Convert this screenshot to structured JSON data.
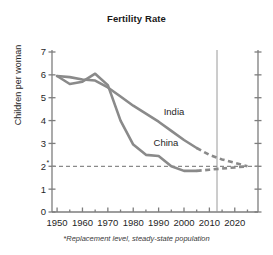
{
  "chart_data": {
    "type": "line",
    "title": "Fertility Rate",
    "xlabel": "",
    "ylabel": "Children per woman",
    "footnote": "*Replacement level, steady-state population",
    "xlim": [
      1948,
      1926
    ],
    "x_axis_range": [
      1948,
      2026
    ],
    "ylim": [
      0,
      7
    ],
    "y_ticks": [
      0,
      1,
      2,
      3,
      4,
      5,
      6,
      7
    ],
    "y_tick_labels": [
      "0",
      "1",
      "2",
      "3",
      "4",
      "5",
      "6",
      "7"
    ],
    "y_tick_label_2_suffix": "*",
    "x_ticks": [
      1950,
      1955,
      1960,
      1965,
      1970,
      1975,
      1980,
      1985,
      1990,
      1995,
      2000,
      2005,
      2010,
      2015,
      2020,
      2025
    ],
    "x_major_ticks": [
      1950,
      1960,
      1970,
      1980,
      1990,
      2000,
      2010,
      2020
    ],
    "x_tick_labels": [
      "1950",
      "1960",
      "1970",
      "1980",
      "1990",
      "2000",
      "2010",
      "2020"
    ],
    "grid": false,
    "legend_position": "inline-labels",
    "replacement_level": {
      "value": 2,
      "label": "2*",
      "style": "dashed",
      "color": "#8a8a8a"
    },
    "projection_divider_year": 2013,
    "line_color": "#8a8a8a",
    "series": [
      {
        "name": "India",
        "label": "India",
        "color": "#8a8a8a",
        "label_x": 1992,
        "label_y": 4.25,
        "observed": [
          {
            "x": 1950,
            "y": 5.95
          },
          {
            "x": 1955,
            "y": 5.9
          },
          {
            "x": 1960,
            "y": 5.8
          },
          {
            "x": 1965,
            "y": 5.75
          },
          {
            "x": 1970,
            "y": 5.45
          },
          {
            "x": 1975,
            "y": 5.05
          },
          {
            "x": 1980,
            "y": 4.65
          },
          {
            "x": 1985,
            "y": 4.3
          },
          {
            "x": 1990,
            "y": 3.95
          },
          {
            "x": 1995,
            "y": 3.55
          },
          {
            "x": 2000,
            "y": 3.15
          },
          {
            "x": 2005,
            "y": 2.8
          }
        ],
        "projected": [
          {
            "x": 2005,
            "y": 2.8
          },
          {
            "x": 2010,
            "y": 2.5
          },
          {
            "x": 2015,
            "y": 2.3
          },
          {
            "x": 2020,
            "y": 2.15
          },
          {
            "x": 2025,
            "y": 2.0
          }
        ]
      },
      {
        "name": "China",
        "label": "China",
        "color": "#8a8a8a",
        "label_x": 1988,
        "label_y": 2.9,
        "observed": [
          {
            "x": 1950,
            "y": 5.95
          },
          {
            "x": 1955,
            "y": 5.6
          },
          {
            "x": 1960,
            "y": 5.7
          },
          {
            "x": 1965,
            "y": 6.05
          },
          {
            "x": 1970,
            "y": 5.55
          },
          {
            "x": 1975,
            "y": 4.0
          },
          {
            "x": 1980,
            "y": 2.95
          },
          {
            "x": 1985,
            "y": 2.5
          },
          {
            "x": 1990,
            "y": 2.45
          },
          {
            "x": 1995,
            "y": 2.0
          },
          {
            "x": 2000,
            "y": 1.8
          },
          {
            "x": 2005,
            "y": 1.8
          }
        ],
        "projected": [
          {
            "x": 2005,
            "y": 1.8
          },
          {
            "x": 2010,
            "y": 1.85
          },
          {
            "x": 2015,
            "y": 1.9
          },
          {
            "x": 2020,
            "y": 1.95
          },
          {
            "x": 2025,
            "y": 2.0
          }
        ]
      }
    ]
  },
  "chart": {
    "title": "Fertility Rate",
    "ylabel": "Children per woman",
    "footnote": "*Replacement level, steady-state population"
  }
}
